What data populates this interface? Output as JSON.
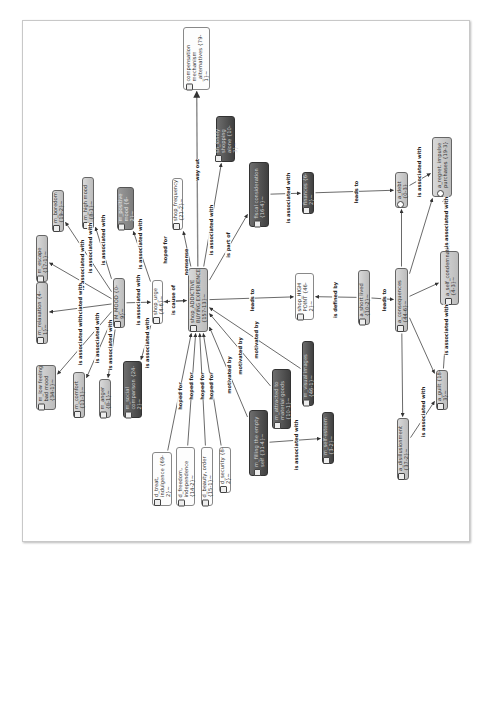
{
  "diagram": {
    "type": "network",
    "orientation": "rotated-90-ccw",
    "nodes": [
      {
        "id": "comp",
        "label": "compensation mechanism _alternatives {79-1}~",
        "style": "light",
        "icon": "document-icon",
        "x": 183,
        "y": 27,
        "w": 27,
        "h": 63
      },
      {
        "id": "main",
        "label": "shop_ADDICTIVE BUYING EXPERIENCE {157-13}~",
        "style": "gray",
        "icon": "document-icon",
        "x": 188,
        "y": 268,
        "w": 20,
        "h": 64
      },
      {
        "id": "nonstop",
        "label": "sh_lonely shopping alone {10-3}~",
        "style": "dark",
        "icon": "document-icon",
        "x": 216,
        "y": 116,
        "w": 19,
        "h": 46
      },
      {
        "id": "freq",
        "label": "shop_frequency {21-2}~",
        "style": "light",
        "icon": "document-icon",
        "x": 172,
        "y": 178,
        "w": 11,
        "h": 52
      },
      {
        "id": "partof",
        "label": "fiscal consideration {16-4}~",
        "style": "dark",
        "icon": "document-icon",
        "x": 249,
        "y": 162,
        "w": 20,
        "h": 65
      },
      {
        "id": "finance",
        "label": "finances {6-2}~",
        "style": "dark",
        "icon": "document-icon",
        "x": 302,
        "y": 172,
        "w": 12,
        "h": 42
      },
      {
        "id": "debt",
        "label": "a_debt {0-3}",
        "style": "gray",
        "icon": "star-icon",
        "x": 395,
        "y": 172,
        "w": 13,
        "h": 36
      },
      {
        "id": "regret",
        "label": "a_regret. impulse purchases {19-3}",
        "style": "gray",
        "icon": "star-icon",
        "x": 432,
        "y": 137,
        "w": 20,
        "h": 60
      },
      {
        "id": "mood",
        "label": "M_MOOD {0-9}~",
        "style": "gray",
        "icon": "document-icon",
        "x": 113,
        "y": 278,
        "w": 12,
        "h": 50
      },
      {
        "id": "urge",
        "label": "shop_urge {4-6}~",
        "style": "light",
        "icon": "document-icon",
        "x": 152,
        "y": 280,
        "w": 11,
        "h": 44
      },
      {
        "id": "escape",
        "label": "m_escape {17-1}~",
        "style": "gray",
        "icon": "document-icon",
        "x": 36,
        "y": 235,
        "w": 12,
        "h": 47
      },
      {
        "id": "boredom",
        "label": "m_boredom {19-2}~",
        "style": "gray",
        "icon": "document-icon",
        "x": 52,
        "y": 190,
        "w": 12,
        "h": 42
      },
      {
        "id": "highmood",
        "label": "m_high mood {8-1}~",
        "style": "gray",
        "icon": "document-icon",
        "x": 82,
        "y": 177,
        "w": 12,
        "h": 52
      },
      {
        "id": "positive",
        "label": "m_positive mood {6-2}~",
        "style": "mid",
        "icon": "document-icon",
        "x": 117,
        "y": 187,
        "w": 17,
        "h": 43
      },
      {
        "id": "relaxation",
        "label": "m_relaxation {4-1}~",
        "style": "gray",
        "icon": "document-icon",
        "x": 36,
        "y": 282,
        "w": 12,
        "h": 62
      },
      {
        "id": "lowmood",
        "label": "m_low feeling bad mood {34-1}~",
        "style": "gray",
        "icon": "document-icon",
        "x": 36,
        "y": 365,
        "w": 20,
        "h": 45
      },
      {
        "id": "comfort",
        "label": "m_comfort {11-1}~",
        "style": "gray",
        "icon": "document-icon",
        "x": 73,
        "y": 372,
        "w": 12,
        "h": 46
      },
      {
        "id": "anger",
        "label": "m_anger {8-1}~",
        "style": "gray",
        "icon": "document-icon",
        "x": 99,
        "y": 379,
        "w": 12,
        "h": 39
      },
      {
        "id": "social",
        "label": "m_social comparison {24-2}~",
        "style": "dark",
        "icon": "document-icon",
        "x": 123,
        "y": 361,
        "w": 19,
        "h": 57
      },
      {
        "id": "highpoint",
        "label": "shop_HIGH POINT {46-2}~",
        "style": "light",
        "icon": "document-icon",
        "x": 295,
        "y": 273,
        "w": 19,
        "h": 47
      },
      {
        "id": "shortlived",
        "label": "a_short lived {10-2}~",
        "style": "gray",
        "icon": "document-icon",
        "x": 358,
        "y": 270,
        "w": 12,
        "h": 55
      },
      {
        "id": "conseq",
        "label": "a_consequences {44-6}~",
        "style": "gray",
        "icon": "document-icon",
        "x": 395,
        "y": 268,
        "w": 13,
        "h": 64
      },
      {
        "id": "selfcond",
        "label": "a_self_condemnation {4-3}~",
        "style": "gray",
        "icon": "document-icon",
        "x": 440,
        "y": 251,
        "w": 19,
        "h": 54
      },
      {
        "id": "guilt",
        "label": "a_guilt {18-3}~",
        "style": "gray",
        "icon": "document-icon",
        "x": 436,
        "y": 370,
        "w": 12,
        "h": 40
      },
      {
        "id": "disill",
        "label": "a_disillusionment {37-2}~",
        "style": "gray",
        "icon": "document-icon",
        "x": 397,
        "y": 418,
        "w": 12,
        "h": 62
      },
      {
        "id": "treat",
        "label": "d_treat, indulgence {69-2}~",
        "style": "light",
        "icon": "document-icon",
        "x": 152,
        "y": 452,
        "w": 20,
        "h": 54
      },
      {
        "id": "freedom",
        "label": "d_freedom, independence {14-2}~",
        "style": "light",
        "icon": "document-icon",
        "x": 176,
        "y": 447,
        "w": 19,
        "h": 59
      },
      {
        "id": "beauty",
        "label": "d_beauty, order {15-1}~",
        "style": "light",
        "icon": "document-icon",
        "x": 201,
        "y": 447,
        "w": 12,
        "h": 59
      },
      {
        "id": "security",
        "label": "d_security {8-2}~",
        "style": "light",
        "icon": "document-icon",
        "x": 219,
        "y": 447,
        "w": 12,
        "h": 46
      },
      {
        "id": "filling",
        "label": "m_filling the empty self {31-4}~",
        "style": "dark",
        "icon": "document-icon",
        "x": 249,
        "y": 410,
        "w": 19,
        "h": 66
      },
      {
        "id": "material",
        "label": "m_attracted to material goods {10-1}~",
        "style": "dark",
        "icon": "document-icon",
        "x": 272,
        "y": 369,
        "w": 19,
        "h": 60
      },
      {
        "id": "visual",
        "label": "m_visual images {46-1}~",
        "style": "dark",
        "icon": "document-icon",
        "x": 302,
        "y": 341,
        "w": 12,
        "h": 65
      },
      {
        "id": "selfesteem",
        "label": "m_self-esteem {3-2}~",
        "style": "dark",
        "icon": "document-icon",
        "x": 322,
        "y": 412,
        "w": 12,
        "h": 52
      }
    ],
    "edges": [
      {
        "from": "main",
        "to": "comp",
        "label": "way out",
        "lx": 197,
        "ly": 170
      },
      {
        "from": "main",
        "to": "nonstop",
        "label": "is associated with",
        "lx": 211,
        "ly": 230
      },
      {
        "from": "main",
        "to": "partof",
        "label": "is part of",
        "lx": 228,
        "ly": 245
      },
      {
        "from": "main",
        "to": "freq",
        "label": "hoped for",
        "lx": 165,
        "ly": 250
      },
      {
        "from": "main",
        "to": "urge",
        "label": "nonsense",
        "lx": 186,
        "ly": 262
      },
      {
        "from": "urge",
        "to": "main",
        "label": "is cause of",
        "lx": 173,
        "ly": 300
      },
      {
        "from": "main",
        "to": "highpoint",
        "label": "leads to",
        "lx": 252,
        "ly": 300
      },
      {
        "from": "shortlived",
        "to": "highpoint",
        "label": "is defined by",
        "lx": 335,
        "ly": 300
      },
      {
        "from": "shortlived",
        "to": "conseq",
        "label": "leads to",
        "lx": 384,
        "ly": 300
      },
      {
        "from": "partof",
        "to": "finance",
        "label": "is associated with",
        "lx": 288,
        "ly": 198
      },
      {
        "from": "finance",
        "to": "debt",
        "label": "leads to",
        "lx": 356,
        "ly": 192
      },
      {
        "from": "debt",
        "to": "regret",
        "label": "is associated with",
        "lx": 419,
        "ly": 172
      },
      {
        "from": "conseq",
        "to": "debt",
        "label": "",
        "lx": 402,
        "ly": 238
      },
      {
        "from": "conseq",
        "to": "regret",
        "label": "",
        "lx": 420,
        "ly": 230
      },
      {
        "from": "conseq",
        "to": "selfcond",
        "label": "",
        "lx": 425,
        "ly": 290
      },
      {
        "from": "selfcond",
        "to": "regret",
        "label": "is associated with",
        "lx": 446,
        "ly": 222
      },
      {
        "from": "conseq",
        "to": "guilt",
        "label": "",
        "lx": 423,
        "ly": 345
      },
      {
        "from": "conseq",
        "to": "disill",
        "label": "",
        "lx": 403,
        "ly": 370
      },
      {
        "from": "guilt",
        "to": "selfcond",
        "label": "is associated with",
        "lx": 446,
        "ly": 330
      },
      {
        "from": "disill",
        "to": "guilt",
        "label": "is associated with",
        "lx": 423,
        "ly": 412
      },
      {
        "from": "mood",
        "to": "urge",
        "label": "is associated with",
        "lx": 138,
        "ly": 300
      },
      {
        "from": "mood",
        "to": "escape",
        "label": "is associated with",
        "lx": 82,
        "ly": 265
      },
      {
        "from": "mood",
        "to": "boredom",
        "label": "is associated with",
        "lx": 90,
        "ly": 248
      },
      {
        "from": "mood",
        "to": "highmood",
        "label": "is associated with",
        "lx": 103,
        "ly": 240
      },
      {
        "from": "urge",
        "to": "positive",
        "label": "is associated with",
        "lx": 140,
        "ly": 244
      },
      {
        "from": "mood",
        "to": "relaxation",
        "label": "associated with",
        "lx": 80,
        "ly": 305
      },
      {
        "from": "mood",
        "to": "lowmood",
        "label": "is associated with",
        "lx": 80,
        "ly": 340
      },
      {
        "from": "mood",
        "to": "comfort",
        "label": "is associated with",
        "lx": 97,
        "ly": 338
      },
      {
        "from": "mood",
        "to": "anger",
        "label": "is associated with",
        "lx": 110,
        "ly": 345
      },
      {
        "from": "urge",
        "to": "social",
        "label": "is associated with",
        "lx": 147,
        "ly": 343
      },
      {
        "from": "treat",
        "to": "main",
        "label": "hoped for",
        "lx": 180,
        "ly": 396
      },
      {
        "from": "freedom",
        "to": "main",
        "label": "hoped for",
        "lx": 191,
        "ly": 386
      },
      {
        "from": "beauty",
        "to": "main",
        "label": "hoped for",
        "lx": 202,
        "ly": 386
      },
      {
        "from": "security",
        "to": "main",
        "label": "hoped for",
        "lx": 211,
        "ly": 386
      },
      {
        "from": "filling",
        "to": "main",
        "label": "motivated by",
        "lx": 229,
        "ly": 375
      },
      {
        "from": "material",
        "to": "main",
        "label": "motivated by",
        "lx": 240,
        "ly": 356
      },
      {
        "from": "visual",
        "to": "main",
        "label": "motivated by",
        "lx": 256,
        "ly": 340
      },
      {
        "from": "filling",
        "to": "selfesteem",
        "label": "is associated with",
        "lx": 296,
        "ly": 445
      }
    ]
  }
}
